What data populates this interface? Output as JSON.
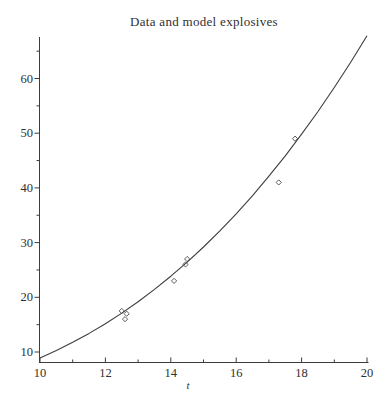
{
  "window": {
    "width": 392,
    "height": 406,
    "background": "#ffffff"
  },
  "chart_data": {
    "type": "scatter",
    "title": "Data and model explosives",
    "xlabel": "t",
    "ylabel": "",
    "xlim": [
      10,
      20
    ],
    "ylim": [
      8.2,
      67.8
    ],
    "grid": false,
    "legend": false,
    "x_major_ticks": [
      10,
      12,
      14,
      16,
      18,
      20
    ],
    "x_minor_ticks": [
      11,
      13,
      15,
      17,
      19
    ],
    "y_major_ticks": [
      10,
      20,
      30,
      40,
      50,
      60
    ],
    "y_minor_ticks": [
      15,
      25,
      35,
      45,
      55,
      65
    ],
    "series": [
      {
        "name": "data",
        "type": "scatter",
        "marker": "open-diamond",
        "points": [
          [
            12.5,
            17.5
          ],
          [
            12.65,
            17.0
          ],
          [
            12.6,
            16.0
          ],
          [
            14.1,
            23.0
          ],
          [
            14.45,
            26.0
          ],
          [
            14.5,
            27.0
          ],
          [
            17.3,
            41.0
          ],
          [
            17.8,
            49.0
          ]
        ]
      },
      {
        "name": "model",
        "type": "line",
        "points": [
          [
            10.0,
            8.9
          ],
          [
            10.5,
            10.27
          ],
          [
            11.0,
            11.77
          ],
          [
            11.5,
            13.4
          ],
          [
            12.0,
            15.18
          ],
          [
            12.5,
            17.11
          ],
          [
            13.0,
            19.2
          ],
          [
            13.5,
            21.44
          ],
          [
            14.0,
            23.85
          ],
          [
            14.5,
            26.44
          ],
          [
            15.0,
            29.2
          ],
          [
            15.5,
            32.14
          ],
          [
            16.0,
            35.27
          ],
          [
            16.5,
            38.6
          ],
          [
            17.0,
            42.13
          ],
          [
            17.5,
            45.86
          ],
          [
            18.0,
            49.81
          ],
          [
            18.5,
            53.97
          ],
          [
            19.0,
            58.36
          ],
          [
            19.5,
            62.97
          ],
          [
            20.0,
            67.82
          ]
        ]
      }
    ],
    "colors": {
      "axis": "#3d3d3d",
      "curve": "#3d3d3d",
      "marker": "#4a4a4a",
      "text": "#2f2f2f",
      "background": "#ffffff"
    }
  }
}
